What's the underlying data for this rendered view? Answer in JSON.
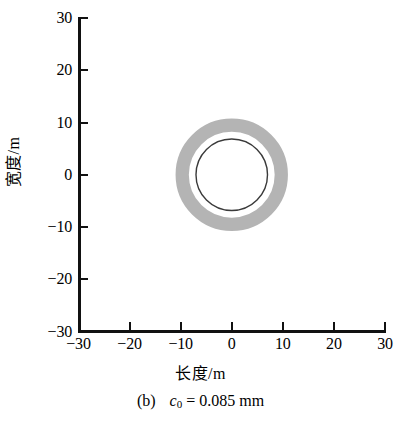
{
  "figure": {
    "caption_label": "(b)",
    "caption_symbol": "c",
    "caption_subscript": "0",
    "caption_rest": "= 0.085 mm"
  },
  "chart_data": {
    "type": "scatter",
    "title": "",
    "xlabel": "长度/m",
    "ylabel": "宽度/m",
    "xlim": [
      -30,
      30
    ],
    "ylim": [
      -30,
      30
    ],
    "xticks": [
      -30,
      -20,
      -10,
      0,
      10,
      20,
      30
    ],
    "yticks": [
      -30,
      -20,
      -10,
      0,
      10,
      20,
      30
    ],
    "xtick_labels": [
      "−30",
      "−20",
      "−10",
      "0",
      "10",
      "20",
      "30"
    ],
    "ytick_labels": [
      "−30",
      "−20",
      "−10",
      "0",
      "10",
      "20",
      "30"
    ],
    "grid": false,
    "legend": "none",
    "annotations": [
      "(b)  c0 = 0.085 mm"
    ],
    "series": [
      {
        "name": "gray-contamination-band",
        "shape": "annulus",
        "center": [
          0,
          0
        ],
        "outer_radius": 11.0,
        "inner_radius": 8.4,
        "color": "#b4b4b4"
      },
      {
        "name": "dark-contour-circle",
        "shape": "circle",
        "center": [
          0,
          0
        ],
        "radius": 7.0,
        "color": "#3a3a3a",
        "line_width": 1.4
      }
    ]
  },
  "colors": {
    "axis": "#111111",
    "band_gray": "#b4b4b4",
    "contour_dark": "#3a3a3a",
    "background": "#ffffff"
  }
}
